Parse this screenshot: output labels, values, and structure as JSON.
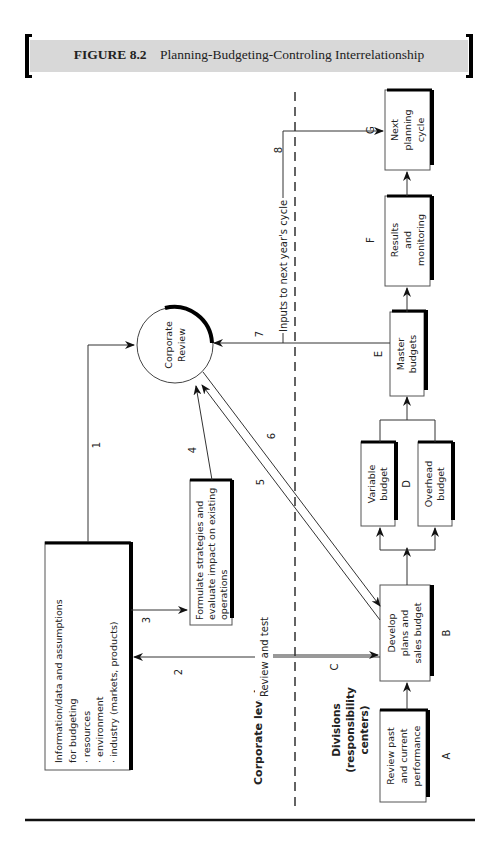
{
  "header": {
    "figure_label": "FIGURE 8.2",
    "title": "Planning-Budgeting-Controling Interrelationship",
    "background_color": "#d8d8d8"
  },
  "levels": {
    "corporate": "Corporate level",
    "divisions": [
      "Divisions",
      "(responsibility",
      "centers)"
    ]
  },
  "nodes": {
    "info": {
      "lines": [
        "Information/data and assumptions",
        "for budgeting",
        "· resources",
        "· environment",
        "· industry (markets, products)"
      ]
    },
    "formulate": {
      "lines": [
        "Formulate strategies and",
        "evaluate impact on existing",
        "operations"
      ]
    },
    "corporate_review": {
      "lines": [
        "Corporate",
        "Review"
      ]
    },
    "A": {
      "letter": "A",
      "lines": [
        "Review past",
        "and current",
        "performance"
      ]
    },
    "B": {
      "letter": "B",
      "lines": [
        "Develop",
        "plans and",
        "sales budget"
      ]
    },
    "D": {
      "letter": "D",
      "variable": [
        "Variable",
        "budget"
      ],
      "overhead": [
        "Overhead",
        "budget"
      ]
    },
    "E": {
      "letter": "E",
      "lines": [
        "Master",
        "budgets"
      ]
    },
    "F": {
      "letter": "F",
      "lines": [
        "Results",
        "and",
        "monitoring"
      ]
    },
    "G": {
      "letter": "G",
      "lines": [
        "Next",
        "planning",
        "cycle"
      ]
    }
  },
  "arrows": {
    "n1": "1",
    "n2": "2",
    "n3": "3",
    "n4": "4",
    "n5": "5",
    "n6": "6",
    "n7": "7",
    "n8": "8",
    "C": "C",
    "review_and_test": "Review and test",
    "inputs_next_year": "Inputs to next year's cycle"
  }
}
